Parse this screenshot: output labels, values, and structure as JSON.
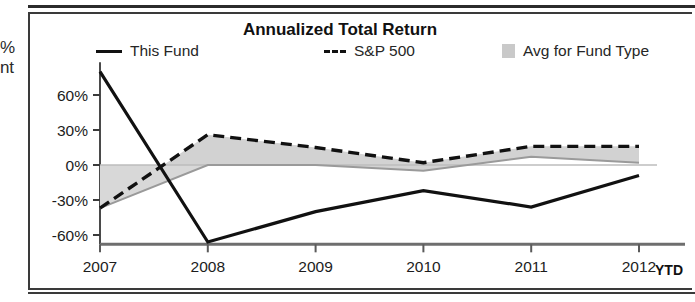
{
  "margin_fragments": {
    "line1": "%",
    "line2": "nt"
  },
  "chart": {
    "title": "Annualized Total Return",
    "ytd_note": "YTD",
    "legend": [
      {
        "label": "This Fund",
        "marker": "solid-line-swatch",
        "color": "#111111"
      },
      {
        "label": "S&P 500",
        "marker": "dashed-line-swatch",
        "color": "#111111"
      },
      {
        "label": "Avg for Fund Type",
        "marker": "filled-area-swatch",
        "color": "#c9c9c9"
      }
    ]
  },
  "chart_data": {
    "type": "line",
    "title": "Annualized Total Return",
    "xlabel": "",
    "ylabel": "",
    "categories": [
      "2007",
      "2008",
      "2009",
      "2010",
      "2011",
      "2012"
    ],
    "x_tick_labels": [
      "2007",
      "2008",
      "2009",
      "2010",
      "2011",
      "2012"
    ],
    "y_tick_labels": [
      "60%",
      "30%",
      "0%",
      "-30%",
      "-60%"
    ],
    "y_ticks": [
      60,
      30,
      0,
      -30,
      -60
    ],
    "ylim": [
      -80,
      88
    ],
    "grid": false,
    "legend_position": "top",
    "series": [
      {
        "name": "This Fund",
        "style": "solid",
        "color": "#111111",
        "values": [
          80,
          -66,
          -40,
          -22,
          -36,
          -9
        ]
      },
      {
        "name": "S&P 500",
        "style": "dashed",
        "color": "#111111",
        "values": [
          -37,
          26,
          15,
          2,
          16,
          16
        ]
      },
      {
        "name": "Avg for Fund Type",
        "style": "area",
        "color": "#c9c9c9",
        "values": [
          -37,
          0,
          0,
          -5,
          7,
          2
        ]
      }
    ],
    "annotations": [
      "YTD"
    ]
  }
}
